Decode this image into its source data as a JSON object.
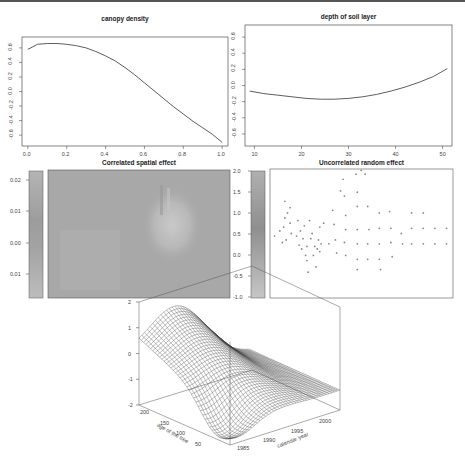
{
  "figure": {
    "panels": 5
  },
  "chart_data": [
    {
      "type": "line",
      "title": "canopy density",
      "xlabel": "",
      "ylabel": "",
      "xlim": [
        0.0,
        1.0
      ],
      "ylim": [
        -0.75,
        0.75
      ],
      "x_ticks": [
        "0.0",
        "0.2",
        "0.4",
        "0.6",
        "0.8",
        "1.0"
      ],
      "y_ticks": [
        "0.6",
        "0.4",
        "0.2",
        "0.0",
        "-0.2",
        "-0.4",
        "-0.6"
      ],
      "x": [
        0.0,
        0.05,
        0.1,
        0.15,
        0.2,
        0.25,
        0.3,
        0.35,
        0.4,
        0.45,
        0.5,
        0.55,
        0.6,
        0.65,
        0.7,
        0.75,
        0.8,
        0.85,
        0.9,
        0.95,
        1.0
      ],
      "y": [
        0.58,
        0.65,
        0.66,
        0.66,
        0.65,
        0.63,
        0.6,
        0.55,
        0.49,
        0.42,
        0.33,
        0.23,
        0.12,
        0.01,
        -0.1,
        -0.21,
        -0.31,
        -0.41,
        -0.5,
        -0.59,
        -0.7
      ],
      "grid": false
    },
    {
      "type": "line",
      "title": "depth of soil layer",
      "xlabel": "",
      "ylabel": "",
      "xlim": [
        8,
        52
      ],
      "ylim": [
        -0.75,
        0.75
      ],
      "x_ticks": [
        "10",
        "20",
        "30",
        "40",
        "50"
      ],
      "y_ticks": [
        "0.6",
        "0.4",
        "0.2",
        "0.0",
        "-0.2",
        "-0.4",
        "-0.6"
      ],
      "x": [
        9,
        12,
        15,
        18,
        21,
        24,
        27,
        30,
        33,
        36,
        39,
        42,
        45,
        48,
        51
      ],
      "y": [
        -0.07,
        -0.1,
        -0.12,
        -0.14,
        -0.16,
        -0.17,
        -0.17,
        -0.16,
        -0.14,
        -0.11,
        -0.07,
        -0.02,
        0.04,
        0.11,
        0.21
      ],
      "grid": false
    },
    {
      "type": "heatmap",
      "title": "Correlated spatial effect",
      "colorbar_ticks": [
        "0.02",
        "0.01",
        "0.00",
        "-0.01"
      ],
      "colorbar_range": [
        -0.015,
        0.025
      ],
      "description": "grey field, lighter vertical streak/bright region right of center"
    },
    {
      "type": "scatter",
      "title": "Uncorrelated random effect",
      "colorbar_ticks": [
        "2.0",
        "1.5",
        "1.0",
        "0.5",
        "0.0",
        "-0.5",
        "-1.0"
      ],
      "colorbar_range": [
        -1.0,
        2.0
      ],
      "points": [
        [
          0.02,
          0.48
        ],
        [
          0.06,
          0.52
        ],
        [
          0.08,
          0.43
        ],
        [
          0.09,
          0.55
        ],
        [
          0.1,
          0.62
        ],
        [
          0.11,
          0.45
        ],
        [
          0.12,
          0.66
        ],
        [
          0.1,
          0.75
        ],
        [
          0.14,
          0.58
        ],
        [
          0.15,
          0.5
        ],
        [
          0.14,
          0.7
        ],
        [
          0.19,
          0.48
        ],
        [
          0.2,
          0.6
        ],
        [
          0.21,
          0.41
        ],
        [
          0.22,
          0.52
        ],
        [
          0.23,
          0.38
        ],
        [
          0.24,
          0.46
        ],
        [
          0.25,
          0.56
        ],
        [
          0.26,
          0.33
        ],
        [
          0.27,
          0.4
        ],
        [
          0.27,
          0.29
        ],
        [
          0.28,
          0.2
        ],
        [
          0.29,
          0.6
        ],
        [
          0.3,
          0.46
        ],
        [
          0.31,
          0.5
        ],
        [
          0.32,
          0.33
        ],
        [
          0.33,
          0.4
        ],
        [
          0.34,
          0.24
        ],
        [
          0.35,
          0.38
        ],
        [
          0.36,
          0.45
        ],
        [
          0.37,
          0.55
        ],
        [
          0.37,
          0.36
        ],
        [
          0.38,
          0.42
        ],
        [
          0.4,
          0.58
        ],
        [
          0.44,
          0.42
        ],
        [
          0.47,
          0.68
        ],
        [
          0.48,
          0.57
        ],
        [
          0.49,
          0.45
        ],
        [
          0.5,
          0.35
        ],
        [
          0.53,
          0.83
        ],
        [
          0.55,
          0.92
        ],
        [
          0.56,
          0.79
        ],
        [
          0.57,
          0.64
        ],
        [
          0.57,
          0.53
        ],
        [
          0.56,
          0.43
        ],
        [
          0.57,
          0.33
        ],
        [
          0.65,
          0.96
        ],
        [
          0.66,
          0.82
        ],
        [
          0.66,
          0.71
        ],
        [
          0.66,
          0.53
        ],
        [
          0.66,
          0.42
        ],
        [
          0.66,
          0.3
        ],
        [
          0.66,
          0.22
        ],
        [
          0.69,
          0.99
        ],
        [
          0.72,
          0.96
        ],
        [
          0.74,
          0.71
        ],
        [
          0.75,
          0.53
        ],
        [
          0.74,
          0.42
        ],
        [
          0.74,
          0.3
        ],
        [
          0.83,
          0.66
        ],
        [
          0.83,
          0.54
        ],
        [
          0.83,
          0.42
        ],
        [
          0.83,
          0.3
        ],
        [
          0.84,
          0.22
        ],
        [
          0.91,
          0.67
        ],
        [
          0.92,
          0.54
        ],
        [
          0.92,
          0.43
        ],
        [
          0.93,
          0.32
        ],
        [
          1.0,
          0.5
        ],
        [
          1.01,
          0.42
        ],
        [
          1.08,
          0.66
        ],
        [
          1.08,
          0.54
        ],
        [
          1.08,
          0.42
        ],
        [
          1.17,
          0.66
        ],
        [
          1.17,
          0.54
        ],
        [
          1.17,
          0.42
        ],
        [
          1.26,
          0.54
        ],
        [
          1.26,
          0.42
        ],
        [
          1.35,
          0.54
        ],
        [
          1.35,
          0.42
        ]
      ],
      "grid": false
    },
    {
      "type": "surface",
      "title": "",
      "xlabel": "calendar year",
      "ylabel": "age of the tree",
      "zlabel": "",
      "x_ticks": [
        "1985",
        "1990",
        "1995",
        "2000"
      ],
      "y_ticks": [
        "50",
        "100",
        "150",
        "200"
      ],
      "z_ticks": [
        "2",
        "1",
        "0",
        "-1",
        "-2"
      ],
      "zlim": [
        -2,
        2
      ],
      "description": "wireframe surface: ridge peaking near ~1.9 at high age / mid-late years, trough near -2 at low age / early years, flattening to about -1 at 2000"
    }
  ],
  "labels": {
    "p1_title": "canopy density",
    "p2_title": "depth of soil layer",
    "p3_title": "Correlated spatial effect",
    "p4_title": "Uncorrelated random effect",
    "p5_xlabel": "calendar year",
    "p5_ylabel": "age of the tree",
    "p1_xticks": [
      "0.0",
      "0.2",
      "0.4",
      "0.6",
      "0.8",
      "1.0"
    ],
    "p1_yticks": [
      "0.6",
      "0.4",
      "0.2",
      "0.0",
      "-0.2",
      "-0.4",
      "-0.6"
    ],
    "p2_xticks": [
      "10",
      "20",
      "30",
      "40",
      "50"
    ],
    "p2_yticks": [
      "0.6",
      "0.4",
      "0.2",
      "0.0",
      "-0.2",
      "-0.4",
      "-0.6"
    ],
    "p3_cbticks": [
      "0.02",
      "0.01",
      "0.00",
      "0.01"
    ],
    "p4_cbticks": [
      "2.0",
      "1.5",
      "1.0",
      "0.5",
      "0.0",
      "-0.5",
      "-1.0"
    ],
    "p5_zticks": [
      "2",
      "1",
      "0",
      "-1",
      "-2"
    ],
    "p5_yticks": [
      "200",
      "150",
      "100",
      "50"
    ],
    "p5_xticks": [
      "1985",
      "1990",
      "1995",
      "2000"
    ]
  }
}
